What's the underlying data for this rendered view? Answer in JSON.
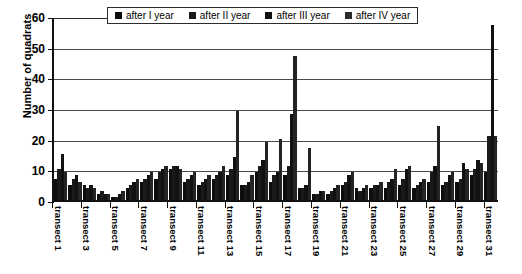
{
  "chart_data": {
    "type": "bar",
    "title": "",
    "xlabel": "",
    "ylabel": "Number of quadrats",
    "ylim": [
      0,
      60
    ],
    "yticks": [
      0,
      10,
      20,
      30,
      40,
      50,
      60
    ],
    "grid": true,
    "legend_position": "top-center",
    "categories": [
      "transect 1",
      "transect 2",
      "transect 3",
      "transect 4",
      "transect 5",
      "transect 6",
      "transect 7",
      "transect 8",
      "transect 9",
      "transect 10",
      "transect 11",
      "transect 12",
      "transect 13",
      "transect 14",
      "transect 15",
      "transect 16",
      "transect 17",
      "transect 18",
      "transect 19",
      "transect 20",
      "transect 21",
      "transect 22",
      "transect 23",
      "transect 24",
      "transect 25",
      "transect 26",
      "transect 27",
      "transect 28",
      "transect 29",
      "transect 30",
      "transect 31"
    ],
    "tick_labels": [
      "transect 1",
      "transect 3",
      "transect 5",
      "transect 7",
      "transect 9",
      "transect 11",
      "transect 13",
      "transect 15",
      "transect 17",
      "transect 19",
      "transect 21",
      "transect 23",
      "transect 25",
      "transect 27",
      "transect 29",
      "transect 31"
    ],
    "series": [
      {
        "name": "after I year",
        "values": [
          7,
          5,
          5,
          2,
          1,
          4,
          6,
          7,
          10,
          6,
          5,
          7,
          8,
          5,
          9,
          6,
          8,
          4,
          2,
          2,
          5,
          4,
          4,
          4,
          5,
          4,
          6,
          5,
          6,
          8,
          9
        ]
      },
      {
        "name": "after II year",
        "values": [
          10,
          7,
          4,
          3,
          1,
          5,
          7,
          9,
          11,
          7,
          6,
          8,
          10,
          5,
          11,
          8,
          11,
          4,
          2,
          3,
          6,
          3,
          5,
          6,
          7,
          5,
          9,
          6,
          7,
          10,
          21
        ]
      },
      {
        "name": "after III year",
        "values": [
          15,
          8,
          5,
          2,
          2,
          6,
          8,
          10,
          11,
          8,
          7,
          9,
          14,
          6,
          13,
          9,
          28,
          5,
          3,
          4,
          8,
          4,
          5,
          7,
          10,
          6,
          11,
          8,
          12,
          13,
          57
        ]
      },
      {
        "name": "after IV year",
        "values": [
          9,
          6,
          4,
          2,
          3,
          7,
          9,
          11,
          10,
          9,
          8,
          11,
          29,
          8,
          19,
          20,
          47,
          17,
          3,
          5,
          9,
          5,
          6,
          10,
          11,
          7,
          24,
          9,
          10,
          12,
          21
        ]
      }
    ]
  },
  "legend": {
    "items": [
      {
        "label": "after I year"
      },
      {
        "label": "after II year"
      },
      {
        "label": "after III year"
      },
      {
        "label": "after IV year"
      }
    ]
  }
}
